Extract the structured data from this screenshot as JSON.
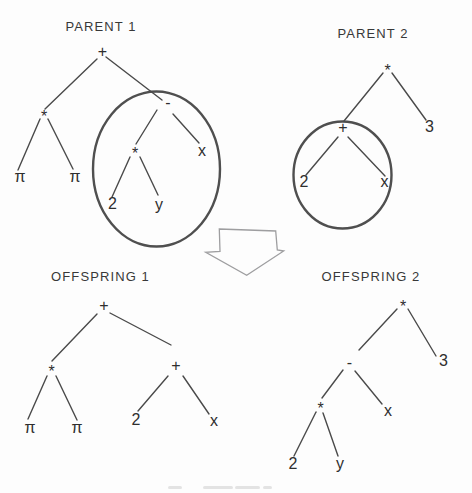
{
  "style": {
    "background": "#fdfdfd",
    "ink": "#2e2e2e",
    "title_color": "#383838",
    "edge_color": "#4a4a4a",
    "highlight_color": "#4f4f4f",
    "arrow_outline_color": "#9e9ea0"
  },
  "diagram": {
    "kind": "genetic-programming-crossover",
    "trees": [
      {
        "name": "parent-1",
        "title": "PARENT 1",
        "title_pos": {
          "x": 101,
          "y": 25.5
        },
        "nodes": [
          {
            "label": "+",
            "x": 102.5,
            "y": 52
          },
          {
            "label": "*",
            "x": 44,
            "y": 112.5
          },
          {
            "label": "-",
            "x": 168,
            "y": 103
          },
          {
            "label": "*",
            "x": 135,
            "y": 149
          },
          {
            "label": "x",
            "x": 202,
            "y": 151
          },
          {
            "label": "π",
            "x": 20,
            "y": 177
          },
          {
            "label": "π",
            "x": 75,
            "y": 177
          },
          {
            "label": "2",
            "x": 112.5,
            "y": 204
          },
          {
            "label": "y",
            "x": 159,
            "y": 205
          }
        ],
        "edges": [
          [
            97,
            59,
            45,
            109
          ],
          [
            106,
            57,
            162,
            100
          ],
          [
            40,
            119,
            18,
            170
          ],
          [
            48,
            119,
            73,
            169
          ],
          [
            157,
            110,
            136,
            144
          ],
          [
            173,
            114,
            199,
            143
          ],
          [
            130,
            157,
            112,
            197
          ],
          [
            140,
            157,
            158,
            195
          ]
        ],
        "highlight_ellipse": {
          "cx": 156.5,
          "cy": 169,
          "rx": 63.5,
          "ry": 77.5
        }
      },
      {
        "name": "parent-2",
        "title": "PARENT 2",
        "title_pos": {
          "x": 373,
          "y": 33
        },
        "nodes": [
          {
            "label": "*",
            "x": 387.5,
            "y": 66
          },
          {
            "label": "+",
            "x": 343,
            "y": 127.5
          },
          {
            "label": "3",
            "x": 429.5,
            "y": 127
          },
          {
            "label": "2",
            "x": 304,
            "y": 182
          },
          {
            "label": "x",
            "x": 384.5,
            "y": 182
          }
        ],
        "edges": [
          [
            383,
            73,
            344,
            121
          ],
          [
            392,
            73,
            426,
            120
          ],
          [
            338,
            137,
            306,
            175
          ],
          [
            348,
            137,
            385,
            176
          ]
        ],
        "highlight_ellipse": {
          "cx": 342.5,
          "cy": 175,
          "rx": 49,
          "ry": 53.5
        }
      },
      {
        "name": "offspring-1",
        "title": "OFFSPRING 1",
        "title_pos": {
          "x": 100.5,
          "y": 275.7
        },
        "nodes": [
          {
            "label": "+",
            "x": 104,
            "y": 306
          },
          {
            "label": "*",
            "x": 51.5,
            "y": 367
          },
          {
            "label": "+",
            "x": 176,
            "y": 366
          },
          {
            "label": "π",
            "x": 30,
            "y": 428
          },
          {
            "label": "π",
            "x": 77,
            "y": 428
          },
          {
            "label": "2",
            "x": 136,
            "y": 420
          },
          {
            "label": "x",
            "x": 214,
            "y": 421
          }
        ],
        "edges": [
          [
            97,
            314,
            52,
            361
          ],
          [
            110,
            313,
            171,
            345
          ],
          [
            47,
            376,
            28,
            419
          ],
          [
            56,
            376,
            77,
            420
          ],
          [
            168,
            376,
            138,
            411
          ],
          [
            183,
            376,
            209,
            414
          ]
        ],
        "highlight_ellipse": null
      },
      {
        "name": "offspring-2",
        "title": "OFFSPRING 2",
        "title_pos": {
          "x": 371,
          "y": 276
        },
        "nodes": [
          {
            "label": "*",
            "x": 403,
            "y": 302
          },
          {
            "label": "-",
            "x": 349.5,
            "y": 363
          },
          {
            "label": "3",
            "x": 443.5,
            "y": 361
          },
          {
            "label": "*",
            "x": 320.5,
            "y": 404.5
          },
          {
            "label": "x",
            "x": 388,
            "y": 411
          },
          {
            "label": "2",
            "x": 293,
            "y": 464
          },
          {
            "label": "y",
            "x": 340,
            "y": 464
          }
        ],
        "edges": [
          [
            397,
            309,
            359,
            350
          ],
          [
            408,
            309,
            436,
            356
          ],
          [
            343,
            370,
            322,
            398
          ],
          [
            355,
            371,
            382,
            404
          ],
          [
            316,
            412,
            294,
            456
          ],
          [
            323,
            413,
            338,
            456
          ]
        ],
        "highlight_ellipse": null
      }
    ],
    "crossover_arrow": {
      "direction": "down",
      "points": [
        [
          219.3,
          229
        ],
        [
          275.7,
          231
        ],
        [
          277.3,
          250
        ],
        [
          283.7,
          251
        ],
        [
          246.7,
          275.3
        ],
        [
          205.7,
          252.3
        ],
        [
          220,
          251.3
        ]
      ]
    }
  }
}
